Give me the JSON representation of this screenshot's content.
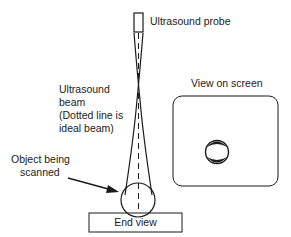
{
  "labels": {
    "probe": "Ultrasound probe",
    "beam_line1": "Ultrasound",
    "beam_line2": "beam",
    "beam_line3": "(Dotted line is",
    "beam_line4": "ideal beam)",
    "object_line1": "Object being",
    "object_line2": "scanned",
    "screen": "View on screen",
    "end_view": "End view"
  },
  "colors": {
    "stroke": "#1a1a1a",
    "background": "#ffffff"
  }
}
